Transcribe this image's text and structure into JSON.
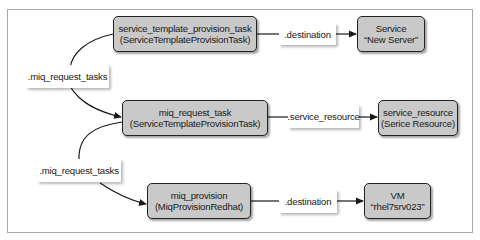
{
  "diagram": {
    "nodes": {
      "service_template_provision_task": {
        "name": "service_template_provision_task",
        "class": "(ServiceTemplateProvisionTask)"
      },
      "service": {
        "name": "Service",
        "class": "“New Server”"
      },
      "miq_request_task": {
        "name": "miq_request_task",
        "class": "(ServiceTemplateProvisionTask)"
      },
      "service_resource": {
        "name": "service_resource",
        "class": "(Serice Resource)"
      },
      "miq_provision": {
        "name": "miq_provision",
        "class": "(MiqProvisionRedhat)"
      },
      "vm": {
        "name": "VM",
        "class": "“rhel7srv023”"
      }
    },
    "edges": {
      "top_destination": ".destination",
      "middle_service_resource": ".service_resource",
      "bottom_destination": ".destination",
      "upper_miq_request_tasks": ".miq_request_tasks",
      "lower_miq_request_tasks": ".miq_request_tasks"
    },
    "colors": {
      "node_fill": "#c9c9c9",
      "node_border": "#222222",
      "line": "#1a1a1a",
      "frame_border": "#a8a8a8",
      "label_fill": "#ffffff"
    }
  }
}
